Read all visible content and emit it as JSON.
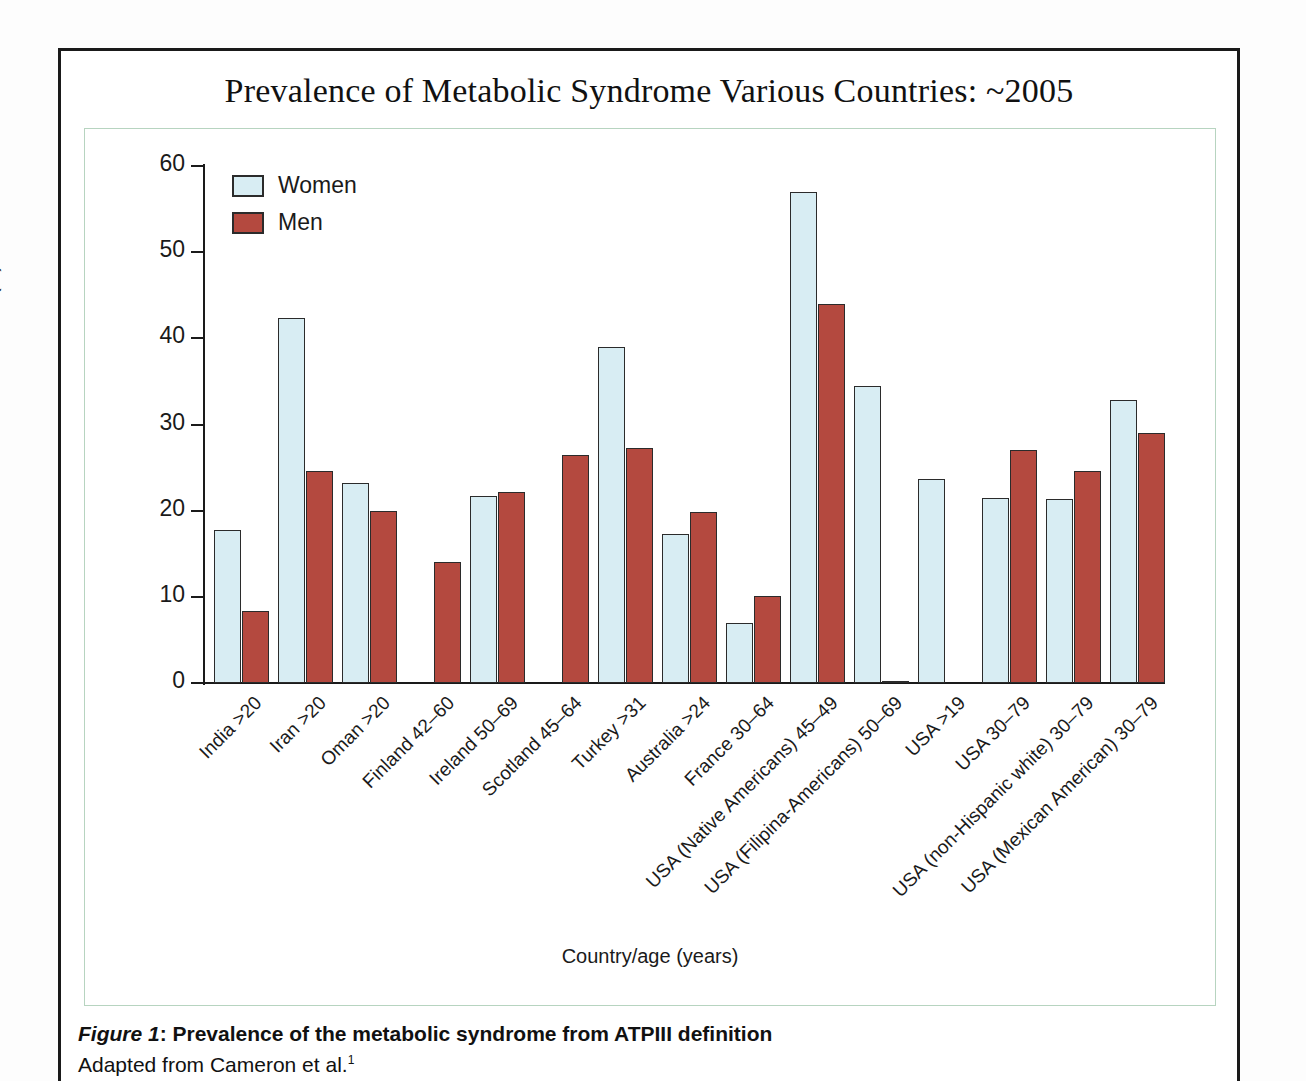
{
  "figure": {
    "title": "Prevalence of Metabolic Syndrome Various Countries: ~2005",
    "caption_label": "Figure 1",
    "caption_text": ": Prevalence of the metabolic syndrome from ATPIII definition",
    "caption_source": "Adapted from Cameron et al.",
    "caption_source_superscript": "1"
  },
  "colors": {
    "women": "#d8edf3",
    "men": "#b4493f",
    "bar_outline": "#2b2b2b",
    "axis": "#1a1a1a",
    "panel_border": "#b7d4c0",
    "page_border": "#1a1a1a"
  },
  "chart_data": {
    "type": "bar",
    "title": "Prevalence of Metabolic Syndrome Various Countries: ~2005",
    "xlabel": "Country/age (years)",
    "ylabel": "Prevalence (%)",
    "ylim": [
      0,
      60
    ],
    "yticks": [
      0,
      10,
      20,
      30,
      40,
      50,
      60
    ],
    "grid": false,
    "legend_position": "top-left",
    "categories": [
      "India >20",
      "Iran >20",
      "Oman >20",
      "Finland 42–60",
      "Ireland 50–69",
      "Scotland 45–64",
      "Turkey >31",
      "Australia >24",
      "France 30–64",
      "USA (Native Americans) 45–49",
      "USA (Filipina-Americans) 50–69",
      "USA >19",
      "USA 30–79",
      "USA (non-Hispanic white) 30–79",
      "USA (Mexican American) 30–79"
    ],
    "series": [
      {
        "name": "Women",
        "color": "#d8edf3",
        "values": [
          17.8,
          42.4,
          23.2,
          null,
          21.7,
          null,
          39.0,
          17.3,
          7.0,
          57.0,
          34.5,
          23.7,
          21.5,
          21.4,
          32.9
        ]
      },
      {
        "name": "Men",
        "color": "#b4493f",
        "values": [
          8.4,
          24.6,
          20.0,
          14.1,
          22.2,
          26.5,
          27.3,
          19.9,
          10.1,
          44.0,
          0.2,
          null,
          27.1,
          24.6,
          29.0
        ]
      }
    ]
  }
}
